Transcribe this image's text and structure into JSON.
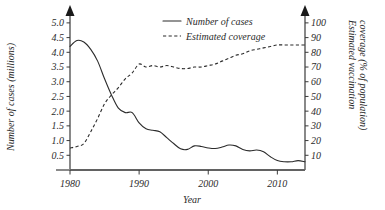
{
  "chart_data": {
    "type": "line",
    "title": "",
    "xlabel": "Year",
    "ylabel": "Number of cases (millions)",
    "y2label": "Estimated vaccination coverage (% of population)",
    "xlim": [
      1980,
      2014
    ],
    "ylim": [
      0,
      5.2
    ],
    "y2lim": [
      0,
      104
    ],
    "grid": false,
    "legend_position": "top-center",
    "x_ticks": [
      "1980",
      "1990",
      "2000",
      "2010"
    ],
    "x_tick_values": [
      1980,
      1990,
      2000,
      2010
    ],
    "y_ticks": [
      "0.5",
      "1.0",
      "1.5",
      "2.0",
      "2.5",
      "3.0",
      "3.5",
      "4.0",
      "4.5",
      "5.0"
    ],
    "y_tick_values": [
      0.5,
      1.0,
      1.5,
      2.0,
      2.5,
      3.0,
      3.5,
      4.0,
      4.5,
      5.0
    ],
    "y2_ticks": [
      "10",
      "20",
      "30",
      "40",
      "50",
      "60",
      "70",
      "80",
      "90",
      "100"
    ],
    "y2_tick_values": [
      10,
      20,
      30,
      40,
      50,
      60,
      70,
      80,
      90,
      100
    ],
    "series": [
      {
        "name": "Number of cases",
        "axis": "left",
        "style": "solid",
        "units": "millions",
        "x": [
          1980,
          1981,
          1982,
          1983,
          1984,
          1985,
          1986,
          1987,
          1988,
          1989,
          1990,
          1991,
          1992,
          1993,
          1994,
          1995,
          1996,
          1997,
          1998,
          1999,
          2000,
          2001,
          2002,
          2003,
          2004,
          2005,
          2006,
          2007,
          2008,
          2009,
          2010,
          2011,
          2012,
          2013,
          2014
        ],
        "values": [
          4.2,
          4.4,
          4.35,
          4.1,
          3.7,
          3.1,
          2.55,
          2.1,
          1.95,
          1.95,
          1.6,
          1.4,
          1.35,
          1.3,
          1.1,
          0.9,
          0.72,
          0.7,
          0.82,
          0.8,
          0.75,
          0.73,
          0.78,
          0.85,
          0.82,
          0.7,
          0.65,
          0.68,
          0.62,
          0.45,
          0.32,
          0.28,
          0.28,
          0.32,
          0.28
        ]
      },
      {
        "name": "Estimated coverage",
        "axis": "right",
        "style": "dashed",
        "units": "% of population",
        "x": [
          1980,
          1981,
          1982,
          1983,
          1984,
          1985,
          1986,
          1987,
          1988,
          1989,
          1990,
          1991,
          1992,
          1993,
          1994,
          1995,
          1996,
          1997,
          1998,
          1999,
          2000,
          2001,
          2002,
          2003,
          2004,
          2005,
          2006,
          2007,
          2008,
          2009,
          2010,
          2011,
          2012,
          2013,
          2014
        ],
        "values": [
          15,
          16,
          18,
          26,
          35,
          45,
          51,
          56,
          62,
          66,
          72,
          70,
          71,
          70,
          71,
          70,
          69,
          69,
          70,
          70,
          71,
          72,
          74,
          76,
          78,
          79,
          81,
          82,
          83,
          84,
          85,
          85,
          85,
          85,
          85
        ]
      }
    ],
    "legend": [
      {
        "label": "Number of cases",
        "style": "solid"
      },
      {
        "label": "Estimated coverage",
        "style": "dashed"
      }
    ],
    "annotations": {
      "left_axis_arrow": "up-arrow",
      "right_axis_arrow": "up-arrow"
    }
  }
}
